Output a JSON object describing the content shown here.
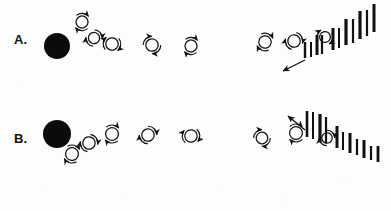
{
  "figure": {
    "background_color": "#fdfdfd",
    "ink_color": "#111111",
    "width": 391,
    "height": 211,
    "caption": ""
  },
  "panels": [
    {
      "id": "A",
      "label": "A.",
      "label_x": 14,
      "label_y": 44,
      "source": {
        "name": "black-sphere",
        "cx": 57,
        "cy": 46,
        "r": 13,
        "fill": "#0b0b0b"
      },
      "particles": [
        {
          "cx": 82,
          "cy": 22,
          "r": 6.0,
          "arc_rot": 20,
          "tail": "ne"
        },
        {
          "cx": 94,
          "cy": 38,
          "r": 5.6,
          "arc_rot": 65,
          "tail": "ne"
        },
        {
          "cx": 112,
          "cy": 44,
          "r": 6.2,
          "arc_rot": 110,
          "tail": "n"
        },
        {
          "cx": 152,
          "cy": 45,
          "r": 6.2,
          "arc_rot": 150,
          "tail": "ne"
        },
        {
          "cx": 191,
          "cy": 46,
          "r": 6.0,
          "arc_rot": 200,
          "tail": "s"
        },
        {
          "cx": 265,
          "cy": 42,
          "r": 6.2,
          "arc_rot": 35,
          "tail": "ne"
        },
        {
          "cx": 294,
          "cy": 41,
          "r": 6.2,
          "arc_rot": 75,
          "tail": "ne"
        },
        {
          "cx": 325,
          "cy": 37,
          "r": 5.4,
          "arc_rot": 120,
          "tail": "n"
        }
      ],
      "bars": [
        {
          "x": 305,
          "y_bottom": 58,
          "height": 16,
          "width": 2.4
        },
        {
          "x": 311,
          "y_bottom": 57,
          "height": 15,
          "width": 2.0
        },
        {
          "x": 317,
          "y_bottom": 55,
          "height": 20,
          "width": 3.0
        },
        {
          "x": 322,
          "y_bottom": 54,
          "height": 19,
          "width": 2.2
        },
        {
          "x": 333,
          "y_bottom": 50,
          "height": 22,
          "width": 3.0
        },
        {
          "x": 339,
          "y_bottom": 48,
          "height": 20,
          "width": 2.0
        },
        {
          "x": 346,
          "y_bottom": 45,
          "height": 26,
          "width": 3.2
        },
        {
          "x": 353,
          "y_bottom": 43,
          "height": 24,
          "width": 2.2
        },
        {
          "x": 360,
          "y_bottom": 39,
          "height": 28,
          "width": 3.2
        },
        {
          "x": 367,
          "y_bottom": 36,
          "height": 26,
          "width": 2.2
        },
        {
          "x": 374,
          "y_bottom": 32,
          "height": 28,
          "width": 3.0
        }
      ],
      "bar_trend": "ascending",
      "pointer": {
        "name": "pointer-arrow",
        "x1": 305,
        "y1": 60,
        "x2": 283,
        "y2": 71,
        "direction": "down-left"
      }
    },
    {
      "id": "B",
      "label": "B.",
      "label_x": 14,
      "label_y": 143,
      "source": {
        "name": "black-sphere",
        "cx": 57,
        "cy": 134,
        "r": 14,
        "fill": "#0b0b0b"
      },
      "particles": [
        {
          "cx": 72,
          "cy": 154,
          "r": 6.4,
          "arc_rot": 210,
          "tail": "s"
        },
        {
          "cx": 89,
          "cy": 143,
          "r": 6.2,
          "arc_rot": 250,
          "tail": "se"
        },
        {
          "cx": 112,
          "cy": 134,
          "r": 6.4,
          "arc_rot": 20,
          "tail": "e"
        },
        {
          "cx": 148,
          "cy": 135,
          "r": 6.2,
          "arc_rot": 60,
          "tail": "e"
        },
        {
          "cx": 191,
          "cy": 136,
          "r": 6.2,
          "arc_rot": 100,
          "tail": "e"
        },
        {
          "cx": 262,
          "cy": 138,
          "r": 5.8,
          "arc_rot": 150,
          "tail": "s"
        },
        {
          "cx": 296,
          "cy": 133,
          "r": 6.4,
          "arc_rot": 195,
          "tail": "se"
        },
        {
          "cx": 327,
          "cy": 138,
          "r": 5.2,
          "arc_rot": 240,
          "tail": "e"
        }
      ],
      "bars": [
        {
          "x": 307,
          "y_bottom": 137,
          "height": 26,
          "width": 2.6
        },
        {
          "x": 313,
          "y_bottom": 139,
          "height": 27,
          "width": 2.0
        },
        {
          "x": 320,
          "y_bottom": 142,
          "height": 28,
          "width": 3.2
        },
        {
          "x": 326,
          "y_bottom": 143,
          "height": 26,
          "width": 2.2
        },
        {
          "x": 337,
          "y_bottom": 148,
          "height": 22,
          "width": 3.0
        },
        {
          "x": 343,
          "y_bottom": 150,
          "height": 18,
          "width": 2.0
        },
        {
          "x": 350,
          "y_bottom": 153,
          "height": 20,
          "width": 3.0
        },
        {
          "x": 357,
          "y_bottom": 155,
          "height": 16,
          "width": 2.2
        },
        {
          "x": 364,
          "y_bottom": 158,
          "height": 18,
          "width": 3.0
        },
        {
          "x": 371,
          "y_bottom": 160,
          "height": 14,
          "width": 2.2
        },
        {
          "x": 378,
          "y_bottom": 162,
          "height": 16,
          "width": 2.8
        }
      ],
      "bar_trend": "descending",
      "pointer": {
        "name": "pointer-arrow",
        "x1": 305,
        "y1": 130,
        "x2": 288,
        "y2": 116,
        "direction": "up-right"
      }
    }
  ]
}
